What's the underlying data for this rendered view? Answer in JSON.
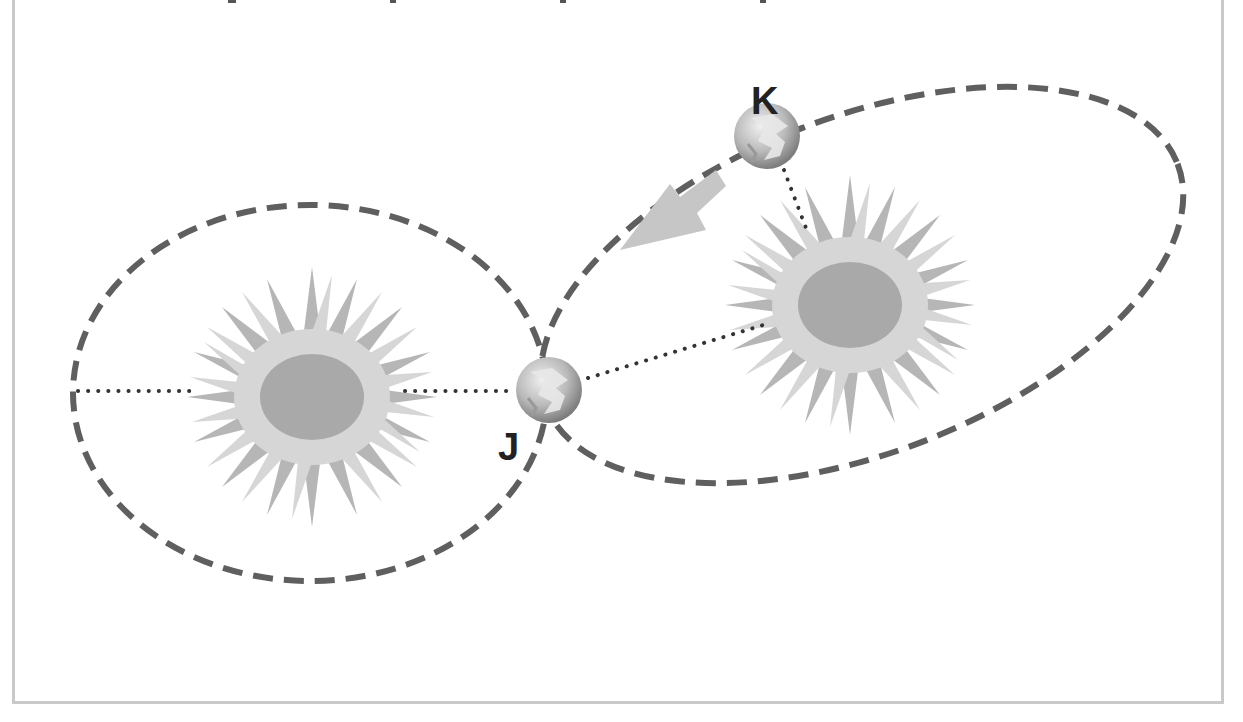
{
  "diagram": {
    "title": "",
    "labels": {
      "planet_j": "J",
      "planet_k": "K"
    },
    "colors": {
      "orbit_dash": "#5f5f5f",
      "dotted_line": "#333333",
      "sun_core": "#a8a8a8",
      "sun_rays_light": "#d4d4d4",
      "sun_rays_dark": "#b4b4b4",
      "arrow": "#c4c4c4",
      "frame": "#c9c9c9"
    },
    "elements": [
      {
        "type": "orbit",
        "name": "left-orbit",
        "shape": "ellipse"
      },
      {
        "type": "orbit",
        "name": "right-orbit",
        "shape": "tilted-ellipse"
      },
      {
        "type": "sun",
        "name": "left-sun"
      },
      {
        "type": "sun",
        "name": "right-sun"
      },
      {
        "type": "planet",
        "name": "planet-j",
        "label": "J"
      },
      {
        "type": "planet",
        "name": "planet-k",
        "label": "K"
      },
      {
        "type": "arrow",
        "name": "motion-arrow",
        "direction": "from K toward J"
      }
    ]
  }
}
